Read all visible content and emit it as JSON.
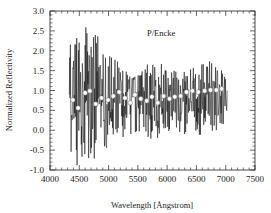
{
  "chart_data": {
    "type": "line",
    "title": "P/Encke",
    "xlabel": "Wavelength  [Ångstrom]",
    "ylabel": "Normalized Reflectivity",
    "xlim": [
      4000,
      7500
    ],
    "ylim": [
      -1.0,
      3.0
    ],
    "x_ticks": [
      4000,
      4500,
      5000,
      5500,
      6000,
      6500,
      7000,
      7500
    ],
    "x_tick_labels": [
      "4000",
      "4500",
      "5000",
      "5500",
      "6000",
      "6500",
      "7000",
      "7500"
    ],
    "y_ticks": [
      -1.0,
      -0.5,
      0.0,
      0.5,
      1.0,
      1.5,
      2.0,
      2.5,
      3.0
    ],
    "y_tick_labels": [
      "-1.0",
      "-0.5",
      "0.0",
      "0.5",
      "1.0",
      "1.5",
      "2.0",
      "2.5",
      "3.0"
    ],
    "grid": false,
    "legend": null,
    "annotation": {
      "text": "P/Encke",
      "x": 6050,
      "y": 2.45
    },
    "series": [
      {
        "name": "spectrum (noisy, vertical-line style)",
        "style": "line",
        "color": "#111111",
        "x_range": [
          4330,
          7030
        ],
        "envelope": {
          "x": [
            4330,
            4400,
            4500,
            4600,
            4700,
            4800,
            4900,
            5000,
            5200,
            5400,
            5600,
            5800,
            6000,
            6200,
            6400,
            6600,
            6800,
            7030
          ],
          "max": [
            2.3,
            2.0,
            2.65,
            2.6,
            2.55,
            2.45,
            2.3,
            2.0,
            1.8,
            1.5,
            1.55,
            1.9,
            1.6,
            1.5,
            1.6,
            1.7,
            1.8,
            1.3
          ],
          "min": [
            -0.5,
            -0.9,
            -1.0,
            -0.6,
            -0.95,
            -0.6,
            -0.85,
            -0.3,
            -0.2,
            -0.1,
            -0.15,
            -0.25,
            -0.1,
            -0.05,
            -0.2,
            -0.1,
            -0.05,
            0.2
          ]
        }
      },
      {
        "name": "binned average",
        "style": "scatter",
        "marker": "open-circle",
        "color": "#ffffff",
        "x": [
          4390,
          4480,
          4600,
          4680,
          4780,
          4880,
          4990,
          5080,
          5180,
          5280,
          5370,
          5450,
          5550,
          5650,
          5740,
          5840,
          5940,
          6040,
          6130,
          6230,
          6330,
          6430,
          6530,
          6640,
          6740,
          6840,
          6930
        ],
        "y": [
          0.76,
          0.56,
          0.94,
          0.99,
          0.66,
          0.81,
          0.76,
          0.86,
          0.96,
          0.81,
          0.69,
          0.89,
          0.79,
          0.74,
          0.84,
          0.69,
          0.86,
          0.79,
          0.84,
          0.86,
          0.96,
          0.99,
          0.96,
          0.99,
          1.01,
          1.01,
          1.04
        ]
      }
    ]
  }
}
